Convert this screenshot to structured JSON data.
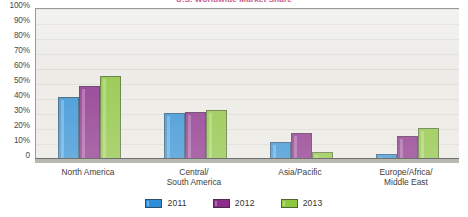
{
  "chart_data": {
    "type": "bar",
    "title": "U.S. Worldwide Market Share",
    "xlabel": "",
    "ylabel": "",
    "ylim": [
      0,
      100
    ],
    "ytick_labels": [
      "100%",
      "90%",
      "80%",
      "70%",
      "60%",
      "50%",
      "40%",
      "30%",
      "20%",
      "10%",
      "0"
    ],
    "ytick_values": [
      100,
      90,
      80,
      70,
      60,
      50,
      40,
      30,
      20,
      10,
      0
    ],
    "grid": true,
    "legend_position": "bottom",
    "categories": [
      "North America",
      "Central/\nSouth America",
      "Asia/Pacific",
      "Europe/Africa/\nMiddle East"
    ],
    "category_lines": [
      [
        "North America"
      ],
      [
        "Central/",
        "South America"
      ],
      [
        "Asia/Pacific"
      ],
      [
        "Europe/Africa/",
        "Middle East"
      ]
    ],
    "series": [
      {
        "name": "2011",
        "color": "#2e8fd8",
        "values": [
          41,
          30,
          11,
          3
        ]
      },
      {
        "name": "2012",
        "color": "#8b2d8b",
        "values": [
          48,
          31,
          17,
          15
        ]
      },
      {
        "name": "2013",
        "color": "#8dc63f",
        "values": [
          55,
          32,
          4,
          20
        ]
      }
    ]
  },
  "colors": {
    "plot_background": "#edece8",
    "axis": "#9a9a9a",
    "gridline": "#ddddd6",
    "baseline": "#b9b9b2",
    "series_2011": "#2e8fd8",
    "series_2012": "#8b2d8b",
    "series_2013": "#8dc63f",
    "title": "#c85a8e"
  }
}
